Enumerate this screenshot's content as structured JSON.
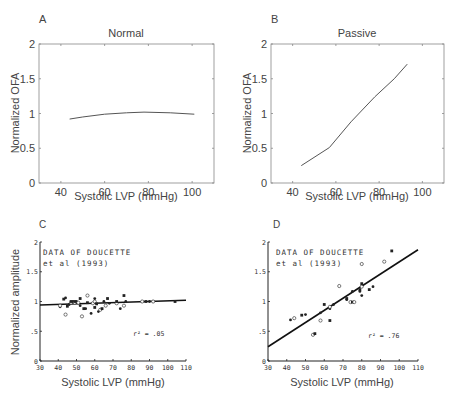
{
  "chart_data": [
    {
      "panel": "A",
      "type": "line",
      "title": "Normal",
      "xlabel": "Systolic LVP (mmHg)",
      "ylabel": "Normalized OFA",
      "xlim": [
        30,
        110
      ],
      "ylim": [
        0,
        2
      ],
      "xticks": [
        "40",
        "60",
        "80",
        "100"
      ],
      "yticks": [
        "0",
        "0.5",
        "1",
        "1.5",
        "2"
      ],
      "x": [
        44,
        50,
        60,
        70,
        78,
        90,
        101
      ],
      "y": [
        0.92,
        0.95,
        0.99,
        1.01,
        1.02,
        1.01,
        0.99
      ]
    },
    {
      "panel": "B",
      "type": "line",
      "title": "Passive",
      "xlabel": "Systolic LVP (mmHg)",
      "ylabel": "Normalized OFA",
      "xlim": [
        30,
        110
      ],
      "ylim": [
        0,
        2
      ],
      "xticks": [
        "40",
        "60",
        "80",
        "100"
      ],
      "yticks": [
        "0",
        "0.5",
        "1",
        "1.5",
        "2"
      ],
      "x": [
        44,
        57,
        67,
        78,
        87,
        93
      ],
      "y": [
        0.25,
        0.51,
        0.88,
        1.24,
        1.5,
        1.71
      ]
    },
    {
      "panel": "C",
      "type": "scatter",
      "title": "",
      "annotation": [
        "DATA OF DOUCETTE",
        "et al (1993)"
      ],
      "r2_label": "r² = .05",
      "xlabel": "Systolic LVP (mmHg)",
      "ylabel": "Normalized amplitude",
      "xlim": [
        30,
        110
      ],
      "ylim": [
        0,
        2
      ],
      "xticks": [
        "30",
        "40",
        "50",
        "60",
        "70",
        "80",
        "90",
        "100",
        "110"
      ],
      "yticks": [
        "0",
        ".5",
        "1",
        "1.5",
        "2"
      ],
      "regression": {
        "x": [
          30,
          110
        ],
        "y": [
          0.94,
          1.02
        ]
      },
      "points": [
        [
          41,
          0.91
        ],
        [
          41,
          0.93
        ],
        [
          43,
          1.04
        ],
        [
          44,
          1.06
        ],
        [
          44,
          0.78
        ],
        [
          45,
          0.92
        ],
        [
          46,
          0.95
        ],
        [
          47,
          0.98
        ],
        [
          47,
          1.0
        ],
        [
          48,
          1.0
        ],
        [
          49,
          0.98
        ],
        [
          49,
          1.0
        ],
        [
          50,
          1.0
        ],
        [
          51,
          0.98
        ],
        [
          52,
          1.05
        ],
        [
          52,
          0.93
        ],
        [
          53,
          0.75
        ],
        [
          54,
          0.88
        ],
        [
          55,
          0.88
        ],
        [
          56,
          1.1
        ],
        [
          56,
          0.98
        ],
        [
          58,
          0.8
        ],
        [
          59,
          0.97
        ],
        [
          60,
          0.9
        ],
        [
          60,
          1.05
        ],
        [
          60,
          1.0
        ],
        [
          61,
          0.96
        ],
        [
          62,
          0.83
        ],
        [
          63,
          0.86
        ],
        [
          64,
          0.88
        ],
        [
          65,
          1.0
        ],
        [
          66,
          0.93
        ],
        [
          67,
          1.05
        ],
        [
          68,
          0.97
        ],
        [
          72,
          0.97
        ],
        [
          72,
          1.0
        ],
        [
          74,
          0.88
        ],
        [
          76,
          0.93
        ],
        [
          76,
          1.1
        ],
        [
          77,
          1.0
        ],
        [
          86,
          1.0
        ],
        [
          88,
          1.0
        ],
        [
          90,
          1.0
        ],
        [
          92,
          1.0
        ],
        [
          104,
          1.0
        ]
      ]
    },
    {
      "panel": "D",
      "type": "scatter",
      "title": "",
      "annotation": [
        "DATA OF DOUCETTE",
        "et al (1993)"
      ],
      "r2_label": "r² = .76",
      "xlabel": "Systolic LVP (mmHg)",
      "ylabel": "",
      "xlim": [
        30,
        110
      ],
      "ylim": [
        0,
        2
      ],
      "xticks": [
        "30",
        "40",
        "50",
        "60",
        "70",
        "80",
        "90",
        "100",
        "110"
      ],
      "yticks": [
        "0",
        ".5",
        "1",
        "1.5",
        "2"
      ],
      "regression": {
        "x": [
          30,
          110
        ],
        "y": [
          0.24,
          1.87
        ]
      },
      "points": [
        [
          42,
          0.69
        ],
        [
          44,
          0.72
        ],
        [
          48,
          0.77
        ],
        [
          50,
          0.78
        ],
        [
          54,
          0.44
        ],
        [
          55,
          0.46
        ],
        [
          58,
          0.81
        ],
        [
          58,
          0.68
        ],
        [
          60,
          0.95
        ],
        [
          63,
          0.88
        ],
        [
          63,
          0.91
        ],
        [
          63,
          0.68
        ],
        [
          65,
          0.95
        ],
        [
          68,
          1.26
        ],
        [
          72,
          1.05
        ],
        [
          72,
          1.03
        ],
        [
          74,
          0.99
        ],
        [
          75,
          0.99
        ],
        [
          75,
          1.17
        ],
        [
          76,
          0.99
        ],
        [
          79,
          1.2
        ],
        [
          79,
          1.17
        ],
        [
          80,
          1.25
        ],
        [
          80,
          1.3
        ],
        [
          80,
          1.1
        ],
        [
          80,
          1.63
        ],
        [
          84,
          1.2
        ],
        [
          86,
          1.25
        ],
        [
          92,
          1.67
        ],
        [
          96,
          1.85
        ]
      ]
    }
  ],
  "panels": {
    "A": {
      "letter": "A",
      "title": "Normal",
      "ylabel": "Normalized OFA",
      "xlabel": "Systolic LVP (mmHg)"
    },
    "B": {
      "letter": "B",
      "title": "Passive",
      "ylabel": "Normalized OFA",
      "xlabel": "Systolic LVP (mmHg)"
    },
    "C": {
      "letter": "C",
      "ylabel": "Normalized amplitude",
      "xlabel": "Systolic LVP (mmHg)",
      "note1": "DATA OF DOUCETTE",
      "note2": "et al (1993)",
      "r2": "r² = .05"
    },
    "D": {
      "letter": "D",
      "xlabel": "Systolic LVP (mmHg)",
      "note1": "DATA OF DOUCETTE",
      "note2": "et al (1993)",
      "r2": "r² = .76"
    }
  }
}
